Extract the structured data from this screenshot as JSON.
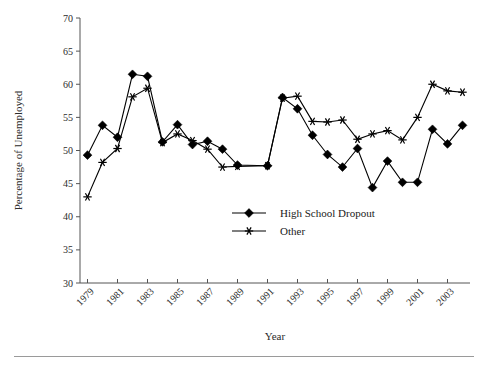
{
  "figure": {
    "background": "#ffffff",
    "line_color": "#000000",
    "axis_color": "#555555",
    "footer_rule_color": "#9a9a9a"
  },
  "axes": {
    "ylabel": "Percentage of Unemployed",
    "xlabel": "Year",
    "ytick_labels": [
      "70",
      "65",
      "60",
      "55",
      "50",
      "45",
      "40",
      "35",
      "30"
    ],
    "xtick_labels": [
      "1979",
      "1981",
      "1983",
      "1985",
      "1987",
      "1989",
      "1991",
      "1993",
      "1995",
      "1997",
      "1999",
      "2001",
      "2003"
    ]
  },
  "legend": {
    "position": "center",
    "entries": [
      {
        "label": "High School Dropout",
        "marker": "diamond-marker"
      },
      {
        "label": "Other",
        "marker": "star-marker"
      }
    ]
  },
  "chart_data": {
    "type": "line",
    "title": "",
    "xlabel": "Year",
    "ylabel": "Percentage of Unemployed",
    "xlim": [
      1978.5,
      2004.5
    ],
    "ylim": [
      30,
      70
    ],
    "ytick_step": 5,
    "xtick_step": 2,
    "grid": false,
    "legend_position": "center",
    "x": [
      1979,
      1980,
      1981,
      1982,
      1983,
      1984,
      1985,
      1986,
      1987,
      1988,
      1989,
      1991,
      1992,
      1993,
      1994,
      1995,
      1996,
      1997,
      1998,
      1999,
      2000,
      2001,
      2002,
      2003,
      2004
    ],
    "series": [
      {
        "name": "High School Dropout",
        "marker": "diamond-marker",
        "values": [
          49.3,
          53.8,
          52.0,
          61.5,
          61.2,
          51.3,
          53.9,
          50.9,
          51.4,
          50.2,
          47.8,
          47.7,
          58.0,
          56.3,
          52.3,
          49.4,
          47.5,
          50.3,
          44.4,
          48.4,
          45.2,
          45.2,
          53.2,
          51.0,
          53.8
        ]
      },
      {
        "name": "Other",
        "marker": "star-marker",
        "values": [
          43.0,
          48.2,
          50.3,
          58.1,
          59.4,
          51.2,
          52.5,
          51.5,
          50.2,
          47.5,
          47.6,
          47.7,
          57.9,
          58.2,
          54.4,
          54.3,
          54.6,
          51.7,
          52.5,
          53.0,
          51.6,
          55.0,
          60.0,
          59.0,
          58.8
        ]
      }
    ],
    "break_after_year": 1989
  }
}
